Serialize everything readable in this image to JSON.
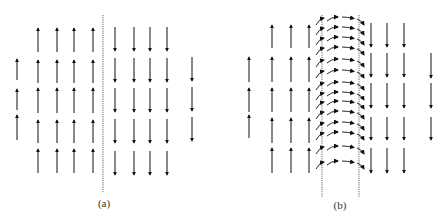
{
  "figure": {
    "colors": {
      "arrow": "#111111",
      "wall_line": "#555555",
      "label": "#333333"
    }
  },
  "panels": [
    {
      "id": "a",
      "label": "(a)",
      "label_pos": [
        104,
        197
      ],
      "walls": [
        {
          "x": 103,
          "y1": 15,
          "y2": 193
        }
      ],
      "up_arrows": [
        {
          "x": 17,
          "y1": 80,
          "y2": 59
        },
        {
          "x": 17,
          "y1": 110,
          "y2": 89
        },
        {
          "x": 17,
          "y1": 140,
          "y2": 115
        },
        {
          "x": 38,
          "y1": 52,
          "y2": 28
        },
        {
          "x": 57,
          "y1": 52,
          "y2": 28
        },
        {
          "x": 74,
          "y1": 52,
          "y2": 28
        },
        {
          "x": 93,
          "y1": 52,
          "y2": 28
        },
        {
          "x": 38,
          "y1": 83,
          "y2": 60
        },
        {
          "x": 57,
          "y1": 83,
          "y2": 60
        },
        {
          "x": 74,
          "y1": 83,
          "y2": 60
        },
        {
          "x": 93,
          "y1": 83,
          "y2": 60
        },
        {
          "x": 38,
          "y1": 113,
          "y2": 88
        },
        {
          "x": 57,
          "y1": 113,
          "y2": 88
        },
        {
          "x": 74,
          "y1": 113,
          "y2": 88
        },
        {
          "x": 93,
          "y1": 113,
          "y2": 88
        },
        {
          "x": 38,
          "y1": 143,
          "y2": 120
        },
        {
          "x": 57,
          "y1": 143,
          "y2": 120
        },
        {
          "x": 74,
          "y1": 143,
          "y2": 120
        },
        {
          "x": 93,
          "y1": 143,
          "y2": 120
        },
        {
          "x": 38,
          "y1": 173,
          "y2": 149
        },
        {
          "x": 57,
          "y1": 173,
          "y2": 149
        },
        {
          "x": 74,
          "y1": 173,
          "y2": 149
        },
        {
          "x": 93,
          "y1": 173,
          "y2": 149
        }
      ],
      "down_arrows": [
        {
          "x": 115,
          "y1": 27,
          "y2": 51
        },
        {
          "x": 134,
          "y1": 27,
          "y2": 51
        },
        {
          "x": 150,
          "y1": 27,
          "y2": 51
        },
        {
          "x": 167,
          "y1": 27,
          "y2": 51
        },
        {
          "x": 115,
          "y1": 58,
          "y2": 82
        },
        {
          "x": 134,
          "y1": 58,
          "y2": 82
        },
        {
          "x": 150,
          "y1": 58,
          "y2": 82
        },
        {
          "x": 167,
          "y1": 58,
          "y2": 82
        },
        {
          "x": 115,
          "y1": 88,
          "y2": 112
        },
        {
          "x": 134,
          "y1": 88,
          "y2": 112
        },
        {
          "x": 150,
          "y1": 88,
          "y2": 112
        },
        {
          "x": 167,
          "y1": 88,
          "y2": 112
        },
        {
          "x": 115,
          "y1": 119,
          "y2": 143
        },
        {
          "x": 134,
          "y1": 119,
          "y2": 143
        },
        {
          "x": 150,
          "y1": 119,
          "y2": 143
        },
        {
          "x": 167,
          "y1": 119,
          "y2": 143
        },
        {
          "x": 115,
          "y1": 151,
          "y2": 175
        },
        {
          "x": 134,
          "y1": 151,
          "y2": 175
        },
        {
          "x": 150,
          "y1": 151,
          "y2": 175
        },
        {
          "x": 167,
          "y1": 151,
          "y2": 175
        },
        {
          "x": 192,
          "y1": 57,
          "y2": 81
        },
        {
          "x": 192,
          "y1": 87,
          "y2": 111
        },
        {
          "x": 192,
          "y1": 117,
          "y2": 141
        }
      ],
      "wall_rows": []
    },
    {
      "id": "b",
      "label": "(b)",
      "label_pos": [
        340,
        199
      ],
      "walls": [
        {
          "x": 322,
          "y1": 15,
          "y2": 197
        },
        {
          "x": 359,
          "y1": 15,
          "y2": 197
        }
      ],
      "up_arrows": [
        {
          "x": 249,
          "y1": 82,
          "y2": 57
        },
        {
          "x": 249,
          "y1": 112,
          "y2": 88
        },
        {
          "x": 249,
          "y1": 138,
          "y2": 115
        },
        {
          "x": 272,
          "y1": 48,
          "y2": 25
        },
        {
          "x": 291,
          "y1": 48,
          "y2": 25
        },
        {
          "x": 309,
          "y1": 48,
          "y2": 25
        },
        {
          "x": 272,
          "y1": 82,
          "y2": 57
        },
        {
          "x": 291,
          "y1": 82,
          "y2": 57
        },
        {
          "x": 309,
          "y1": 82,
          "y2": 57
        },
        {
          "x": 272,
          "y1": 112,
          "y2": 88
        },
        {
          "x": 291,
          "y1": 112,
          "y2": 88
        },
        {
          "x": 309,
          "y1": 112,
          "y2": 88
        },
        {
          "x": 272,
          "y1": 143,
          "y2": 118
        },
        {
          "x": 291,
          "y1": 143,
          "y2": 118
        },
        {
          "x": 309,
          "y1": 143,
          "y2": 118
        },
        {
          "x": 272,
          "y1": 173,
          "y2": 148
        },
        {
          "x": 291,
          "y1": 173,
          "y2": 148
        },
        {
          "x": 309,
          "y1": 173,
          "y2": 148
        }
      ],
      "down_arrows": [
        {
          "x": 371,
          "y1": 23,
          "y2": 47
        },
        {
          "x": 387,
          "y1": 23,
          "y2": 47
        },
        {
          "x": 404,
          "y1": 23,
          "y2": 47
        },
        {
          "x": 371,
          "y1": 53,
          "y2": 77
        },
        {
          "x": 387,
          "y1": 53,
          "y2": 77
        },
        {
          "x": 404,
          "y1": 53,
          "y2": 77
        },
        {
          "x": 371,
          "y1": 83,
          "y2": 108
        },
        {
          "x": 387,
          "y1": 83,
          "y2": 108
        },
        {
          "x": 404,
          "y1": 83,
          "y2": 108
        },
        {
          "x": 371,
          "y1": 117,
          "y2": 140
        },
        {
          "x": 387,
          "y1": 117,
          "y2": 140
        },
        {
          "x": 404,
          "y1": 117,
          "y2": 140
        },
        {
          "x": 371,
          "y1": 148,
          "y2": 173
        },
        {
          "x": 387,
          "y1": 148,
          "y2": 173
        },
        {
          "x": 404,
          "y1": 148,
          "y2": 173
        },
        {
          "x": 431,
          "y1": 53,
          "y2": 78
        },
        {
          "x": 431,
          "y1": 83,
          "y2": 108
        },
        {
          "x": 431,
          "y1": 117,
          "y2": 140
        }
      ],
      "wall_rows": [
        18,
        28,
        38,
        48,
        60,
        71,
        83,
        93,
        102,
        112,
        123,
        133,
        147,
        162
      ]
    }
  ]
}
